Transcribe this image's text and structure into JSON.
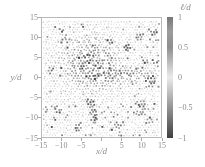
{
  "figure": {
    "colors": {
      "background": "#ffffff",
      "border": "#b9b9b9",
      "tick": "#aaaaaa",
      "text": "#8c8c8c"
    }
  },
  "chart_data": {
    "type": "scatter",
    "title": "",
    "xlabel": "x/d",
    "ylabel": "y/d",
    "colorbar_label": "ℓ/d",
    "xlim": [
      -15,
      15
    ],
    "ylim": [
      -15,
      15
    ],
    "clim": [
      -1,
      1
    ],
    "grid": false,
    "legend": "none",
    "marker": "small square grains",
    "x_tick_values": [
      -15,
      -10,
      -5,
      5,
      10,
      15
    ],
    "x_tick_labels": [
      "−15",
      "−10",
      "−5",
      "5",
      "10",
      "15"
    ],
    "x_tickmark_values": [
      -15,
      -10,
      -5,
      0,
      5,
      10,
      15
    ],
    "y_tick_values": [
      15,
      10,
      5,
      0,
      -5,
      -10,
      -15
    ],
    "y_tick_labels": [
      "15",
      "10",
      "5",
      "0",
      "−5",
      "−10",
      "−15"
    ],
    "y_tickmark_values": [
      -15,
      -10,
      -5,
      0,
      5,
      10,
      15
    ],
    "colorbar_tick_values": [
      1,
      0.5,
      0,
      -0.5,
      -1
    ],
    "colorbar_tick_labels": [
      "1",
      "0.5",
      "0",
      "−0.5",
      "−1"
    ],
    "colormap_stops": [
      {
        "pos": 0.0,
        "color": "#787878"
      },
      {
        "pos": 0.12,
        "color": "#9c9c9c"
      },
      {
        "pos": 0.25,
        "color": "#8e8e8e"
      },
      {
        "pos": 0.5,
        "color": "#ebebeb"
      },
      {
        "pos": 0.75,
        "color": "#939393"
      },
      {
        "pos": 1.0,
        "color": "#404040"
      }
    ],
    "pattern": {
      "description": "≈1500 grains on a jittered hexagonal lattice (spacing ≈0.75 d) colored by ℓ/d; dense dark cluster centered near (−2.5, 3), a horizontal dark streak near y≈1 reaching x≈13, and scattered dark grains near the bottom and right edges",
      "seed": 11,
      "lattice_spacing": 0.75,
      "jitter": 0.22,
      "vacancy_prob": 0.07,
      "background_noise": 0.1,
      "cluster": {
        "center": [
          -2.5,
          3.2
        ],
        "sigma": 4.2,
        "amplitude": 0.9
      },
      "streak": {
        "y": 0.9,
        "sigma_y": 1.1,
        "x_center": 6,
        "sigma_x": 5.5,
        "amplitude": 0.6
      },
      "outlier_prob": 0.045,
      "edge_outlier_boost": 0.05,
      "hotspots": [
        [
          -9,
          9.5
        ],
        [
          -10,
          12
        ],
        [
          9.5,
          10
        ],
        [
          13,
          11.5
        ],
        [
          12.5,
          0
        ],
        [
          12.8,
          -1.5
        ],
        [
          13.5,
          4
        ],
        [
          -3,
          -6
        ],
        [
          -2.5,
          -7.5
        ],
        [
          -2,
          -9
        ],
        [
          -1.8,
          -10.5
        ],
        [
          10,
          -6.5
        ],
        [
          10.3,
          -7.8
        ],
        [
          9.5,
          -8.6
        ],
        [
          4,
          -12
        ],
        [
          -6,
          -12.5
        ],
        [
          -11,
          -8
        ],
        [
          -13,
          2
        ],
        [
          6.5,
          7.5
        ],
        [
          12,
          -11
        ]
      ]
    }
  }
}
